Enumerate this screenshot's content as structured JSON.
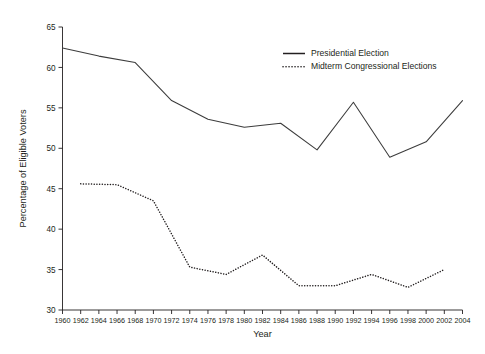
{
  "chart_data": {
    "type": "line",
    "title": "",
    "xlabel": "Year",
    "ylabel": "Percentage of Eligible Voters",
    "xlim": [
      1960,
      2004
    ],
    "ylim": [
      30,
      65
    ],
    "grid": false,
    "legend_position": "top-right",
    "x_ticks": [
      1960,
      1962,
      1964,
      1966,
      1968,
      1970,
      1972,
      1974,
      1976,
      1978,
      1980,
      1982,
      1984,
      1986,
      1988,
      1990,
      1992,
      1994,
      1996,
      1998,
      2000,
      2002,
      2004
    ],
    "y_ticks": [
      30,
      35,
      40,
      45,
      50,
      55,
      60,
      65
    ],
    "series": [
      {
        "name": "Presidential Election",
        "style": "solid",
        "x": [
          1960,
          1964,
          1968,
          1972,
          1976,
          1980,
          1984,
          1988,
          1992,
          1996,
          2000,
          2004
        ],
        "values": [
          62.4,
          61.4,
          60.6,
          55.9,
          53.6,
          52.6,
          53.1,
          49.8,
          55.7,
          48.9,
          50.8,
          55.9
        ]
      },
      {
        "name": "Midterm Congressional Elections",
        "style": "dotted",
        "x": [
          1962,
          1966,
          1970,
          1974,
          1978,
          1982,
          1986,
          1990,
          1994,
          1998,
          2002
        ],
        "values": [
          45.6,
          45.5,
          43.5,
          35.3,
          34.4,
          36.8,
          33.0,
          33.0,
          34.4,
          32.8,
          35.0
        ]
      }
    ]
  },
  "legend": {
    "items": [
      {
        "label": "Presidential Election",
        "style": "solid"
      },
      {
        "label": "Midterm Congressional Elections",
        "style": "dotted"
      }
    ]
  }
}
